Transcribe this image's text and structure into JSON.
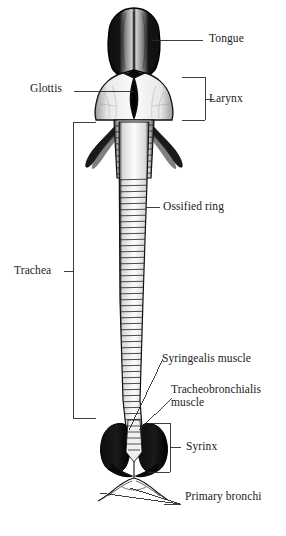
{
  "figure": {
    "type": "anatomical-diagram",
    "colors": {
      "background": "#ffffff",
      "ink": "#111111",
      "leader_line": "#2a2a2a",
      "label_text": "#1b1b1b"
    },
    "labels": [
      {
        "id": "tongue",
        "text": "Tongue",
        "x": 209,
        "y": 38,
        "leader": "line",
        "bracket": false
      },
      {
        "id": "glottis",
        "text": "Glottis",
        "x": 30,
        "y": 88,
        "leader": "line",
        "bracket": false
      },
      {
        "id": "larynx",
        "text": "Larynx",
        "x": 209,
        "y": 92,
        "leader": "bracket",
        "bracket": true
      },
      {
        "id": "ossified-ring",
        "text": "Ossified ring",
        "x": 163,
        "y": 203,
        "leader": "line",
        "bracket": false
      },
      {
        "id": "trachea",
        "text": "Trachea",
        "x": 14,
        "y": 267,
        "leader": "bracket",
        "bracket": true
      },
      {
        "id": "syringealis-muscle",
        "text": "Syringealis muscle",
        "x": 162,
        "y": 352,
        "leader": "line",
        "bracket": false
      },
      {
        "id": "tracheobronchialis-muscle",
        "text": "Tracheobronchialis muscle",
        "x": 171,
        "y": 383,
        "leader": "line",
        "bracket": false
      },
      {
        "id": "syrinx",
        "text": "Syrinx",
        "x": 186,
        "y": 443,
        "leader": "bracket",
        "bracket": true
      },
      {
        "id": "primary-bronchi",
        "text": "Primary bronchi",
        "x": 185,
        "y": 497,
        "leader": "line",
        "bracket": false
      }
    ],
    "structures": [
      {
        "id": "tongue-body",
        "name": "tongue"
      },
      {
        "id": "larynx-body",
        "name": "larynx"
      },
      {
        "id": "glottis-slit",
        "name": "glottis"
      },
      {
        "id": "hyoid-horn-left",
        "name": "left laryngeal horn"
      },
      {
        "id": "hyoid-horn-right",
        "name": "right laryngeal horn"
      },
      {
        "id": "trachea-tube",
        "name": "trachea with ossified rings"
      },
      {
        "id": "syrinx-lobe-left",
        "name": "left syrinx lobe"
      },
      {
        "id": "syrinx-lobe-right",
        "name": "right syrinx lobe"
      },
      {
        "id": "bronchus-left",
        "name": "left primary bronchus"
      },
      {
        "id": "bronchus-right",
        "name": "right primary bronchus"
      }
    ]
  }
}
